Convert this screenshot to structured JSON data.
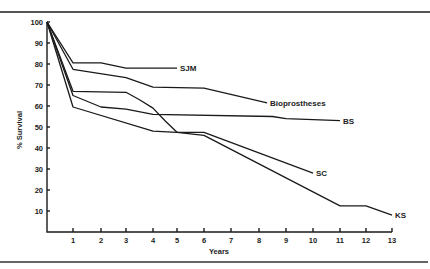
{
  "chart_data": {
    "type": "line",
    "title": "",
    "xlabel": "Years",
    "ylabel": "% Survival",
    "xlim": [
      0,
      13
    ],
    "ylim": [
      0,
      100
    ],
    "x_ticks": [
      1,
      2,
      3,
      4,
      5,
      6,
      7,
      8,
      9,
      10,
      11,
      12,
      13
    ],
    "y_ticks": [
      10,
      20,
      30,
      40,
      50,
      60,
      70,
      80,
      90,
      100
    ],
    "grid": false,
    "legend": "inline labels at line ends",
    "series": [
      {
        "name": "SJM",
        "x": [
          0,
          1,
          2,
          3,
          5
        ],
        "y": [
          100,
          80.5,
          80.5,
          78,
          78
        ]
      },
      {
        "name": "Bioprostheses",
        "x": [
          0,
          1,
          3,
          4,
          6,
          8.3
        ],
        "y": [
          100,
          77.5,
          73.5,
          69,
          68.5,
          61.5
        ]
      },
      {
        "name": "BS",
        "x": [
          0,
          1,
          2,
          3,
          4,
          8.5,
          9,
          11
        ],
        "y": [
          100,
          65,
          59.5,
          58.5,
          56,
          55,
          54,
          53
        ]
      },
      {
        "name": "SC",
        "x": [
          0,
          1,
          3,
          3.5,
          4,
          4.5,
          5,
          6,
          10
        ],
        "y": [
          100,
          67,
          66.5,
          63,
          59,
          53,
          47.5,
          47.5,
          28
        ]
      },
      {
        "name": "KS",
        "x": [
          0,
          1,
          4,
          5,
          6,
          11,
          12,
          13
        ],
        "y": [
          100,
          59.5,
          48,
          47.5,
          46,
          12.5,
          12.5,
          8
        ]
      }
    ]
  },
  "labels": {
    "xlabel": "Years",
    "ylabel": "% Survival",
    "series": [
      "SJM",
      "Bioprostheses",
      "BS",
      "SC",
      "KS"
    ]
  }
}
